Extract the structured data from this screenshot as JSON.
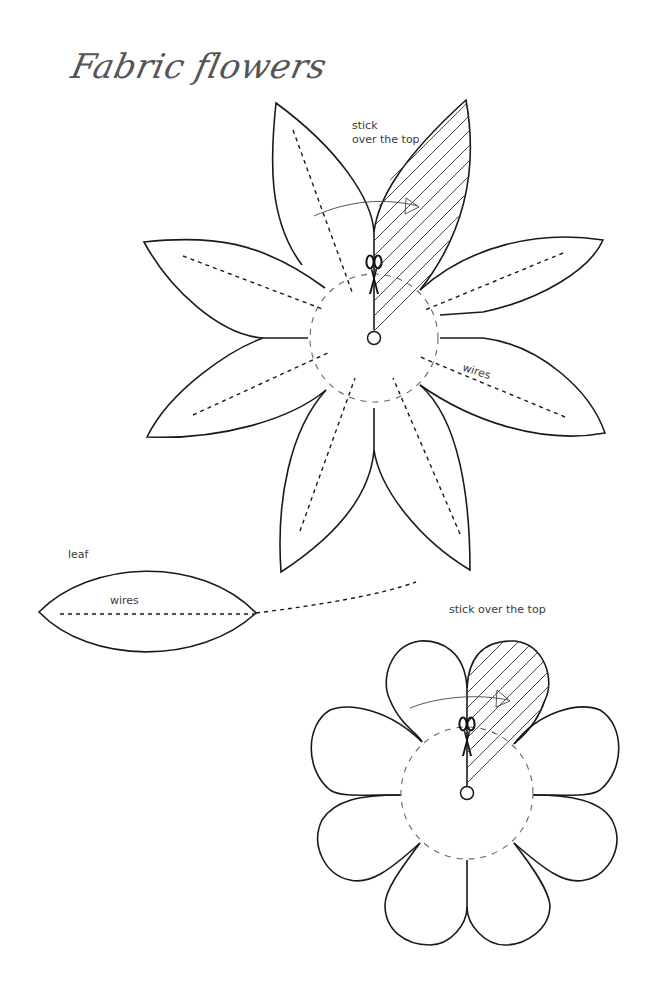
{
  "page": {
    "title": "Fabric flowers"
  },
  "large_flower": {
    "label_stick_line1": "stick",
    "label_stick_line2": "over the top",
    "label_wires": "wires",
    "petal_count": 8,
    "petal_shape": "pointed",
    "icon": "scissors-icon"
  },
  "leaf": {
    "label": "leaf",
    "label_wires": "wires"
  },
  "small_flower": {
    "label_stick": "stick over the top",
    "petal_count": 8,
    "petal_shape": "rounded",
    "icon": "scissors-icon"
  },
  "colors": {
    "line": "#1a1a1a",
    "title": "#555555",
    "background": "#ffffff"
  }
}
